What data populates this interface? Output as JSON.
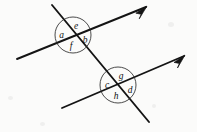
{
  "figure": {
    "background_color": "#fbfbfa",
    "ink_color": "#141414",
    "width": 197,
    "height": 132
  },
  "lines": [
    {
      "id": "upper-parallel-line",
      "role": "parallel-line",
      "label": "upper parallel line",
      "x1": 17,
      "y1": 59,
      "x2": 146,
      "y2": 7,
      "stroke_width": 1.9,
      "arrow_at_end": true
    },
    {
      "id": "lower-parallel-line",
      "role": "parallel-line",
      "label": "lower parallel line",
      "x1": 62,
      "y1": 108,
      "x2": 184,
      "y2": 56,
      "stroke_width": 1.9,
      "arrow_at_end": true
    },
    {
      "id": "transversal-line",
      "role": "transversal",
      "label": "transversal",
      "x1": 52,
      "y1": 5,
      "x2": 149,
      "y2": 122,
      "stroke_width": 1.9,
      "arrow_at_end": false
    }
  ],
  "intersections": [
    {
      "id": "upper-intersection",
      "label": "upper intersection",
      "cx": 73,
      "cy": 35,
      "radius": 18,
      "angles": [
        {
          "key": "a",
          "text": "a",
          "position": "left",
          "x": 61.5,
          "y": 37.5
        },
        {
          "key": "e",
          "text": "e",
          "position": "top",
          "x": 76.0,
          "y": 29.0
        },
        {
          "key": "b",
          "text": "b",
          "position": "right",
          "x": 85.0,
          "y": 43.0
        },
        {
          "key": "f",
          "text": "f",
          "position": "bottom",
          "x": 71.0,
          "y": 48.5
        }
      ]
    },
    {
      "id": "lower-intersection",
      "label": "lower intersection",
      "cx": 118,
      "cy": 85,
      "radius": 18,
      "angles": [
        {
          "key": "c",
          "text": "c",
          "position": "left",
          "x": 107.0,
          "y": 87.5
        },
        {
          "key": "g",
          "text": "g",
          "position": "top",
          "x": 121.0,
          "y": 79.0
        },
        {
          "key": "d",
          "text": "d",
          "position": "right",
          "x": 130.0,
          "y": 92.5
        },
        {
          "key": "h",
          "text": "h",
          "position": "bottom",
          "x": 116.0,
          "y": 98.5
        }
      ]
    }
  ],
  "arrowheads": [
    {
      "id": "upper-arrowhead",
      "label": "upper line arrowhead",
      "tip_x": 147,
      "tip_y": 6,
      "angle_deg": -21.9
    },
    {
      "id": "lower-arrowhead",
      "label": "lower line arrowhead",
      "tip_x": 185,
      "tip_y": 55,
      "angle_deg": -23.1
    }
  ]
}
